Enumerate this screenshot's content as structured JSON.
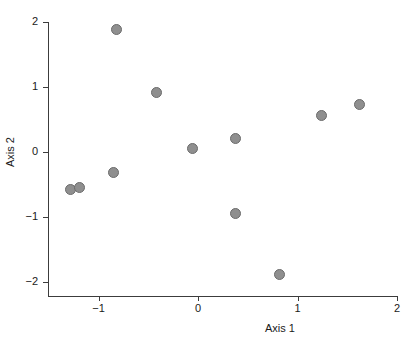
{
  "chart_data": {
    "type": "scatter",
    "title": "",
    "xlabel": "Axis 1",
    "ylabel": "Axis 2",
    "xlim": [
      -1.45,
      2.0
    ],
    "ylim": [
      -2.1,
      2.05
    ],
    "xticks": [
      -1,
      0,
      1,
      2
    ],
    "xtick_labels": [
      "−1",
      "0",
      "1",
      "2"
    ],
    "yticks": [
      2,
      1,
      0,
      -1,
      -2
    ],
    "ytick_labels": [
      "2",
      "1",
      "0",
      "−1",
      "−2"
    ],
    "grid": false,
    "legend": null,
    "marker": {
      "shape": "circle",
      "fill_color": "#8f8f8f",
      "edge_color": "#6b6b6b",
      "size_px": 11
    },
    "axis_color": "#3c3c3c",
    "background_color": "#ffffff",
    "points": [
      {
        "x": -1.28,
        "y": -0.57
      },
      {
        "x": -1.19,
        "y": -0.54
      },
      {
        "x": -0.85,
        "y": -0.31
      },
      {
        "x": -0.82,
        "y": 1.88
      },
      {
        "x": -0.42,
        "y": 0.91
      },
      {
        "x": -0.06,
        "y": 0.05
      },
      {
        "x": 0.38,
        "y": 0.21
      },
      {
        "x": 0.38,
        "y": -0.94
      },
      {
        "x": 0.82,
        "y": -1.88
      },
      {
        "x": 1.24,
        "y": 0.56
      },
      {
        "x": 1.62,
        "y": 0.73
      }
    ]
  },
  "axes": {
    "x_title": "Axis 1",
    "y_title": "Axis 2"
  }
}
